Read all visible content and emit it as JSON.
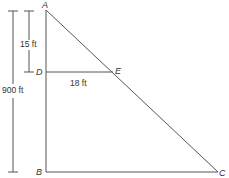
{
  "diagram": {
    "points": [
      {
        "name": "A",
        "x": 46,
        "y": 10
      },
      {
        "name": "D",
        "x": 46,
        "y": 72
      },
      {
        "name": "E",
        "x": 113,
        "y": 72
      },
      {
        "name": "B",
        "x": 46,
        "y": 172
      },
      {
        "name": "C",
        "x": 218,
        "y": 172
      }
    ],
    "labels": {
      "A": "A",
      "B": "B",
      "C": "C",
      "D": "D",
      "E": "E",
      "ad_length": "15 ft",
      "de_length": "18 ft",
      "ab_length": "900 ft"
    },
    "colors": {
      "line": "#555555",
      "text": "#333333"
    }
  }
}
